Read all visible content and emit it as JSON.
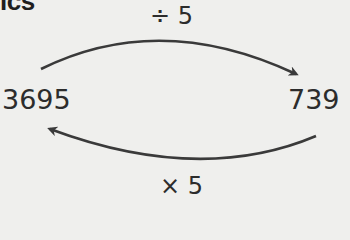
{
  "heading": {
    "visible_text": "ics"
  },
  "diagram": {
    "top_operation": "÷ 5",
    "left_number": "3695",
    "right_number": "739",
    "bottom_operation": "× 5",
    "arrows": [
      {
        "from": "3695",
        "to": "739",
        "direction": "left-to-right",
        "position": "top",
        "label": "÷ 5"
      },
      {
        "from": "739",
        "to": "3695",
        "direction": "right-to-left",
        "position": "bottom",
        "label": "× 5"
      }
    ],
    "stroke_color": "#3a3a3a"
  }
}
